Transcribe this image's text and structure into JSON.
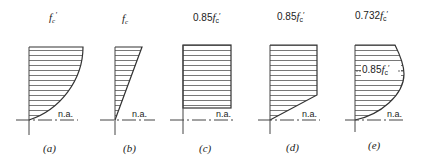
{
  "figure": {
    "panels": [
      {
        "id": "a",
        "top_label": "f′c",
        "top_label_prefix": "",
        "caption": "(a)",
        "na_label": "n.a.",
        "shape": "parabolic"
      },
      {
        "id": "b",
        "top_label": "fc",
        "top_label_prefix": "",
        "caption": "(b)",
        "na_label": "n.a.",
        "shape": "triangular"
      },
      {
        "id": "c",
        "top_label": "fc′",
        "top_label_prefix": "0.85",
        "caption": "(c)",
        "na_label": "n.a.",
        "shape": "rectangular"
      },
      {
        "id": "d",
        "top_label": "fc′",
        "top_label_prefix": "0.85",
        "caption": "(d)",
        "na_label": "n.a.",
        "shape": "trapezoidal"
      },
      {
        "id": "e",
        "top_label": "fc′",
        "top_label_prefix": "0.732",
        "caption": "(e)",
        "na_label": "n.a.",
        "shape": "curved",
        "inner_label_prefix": "0.85",
        "inner_label": "fc′"
      }
    ],
    "labels": {
      "a_top": "f",
      "a_sub": "c",
      "a_prime": "′",
      "b_top": "f",
      "b_sub": "c",
      "c_num": "0.85",
      "c_f": "f",
      "c_sub": "c",
      "c_prime": "′",
      "d_num": "0.85",
      "d_f": "f",
      "d_sub": "c",
      "d_prime": "′",
      "e_num": "0.732",
      "e_f": "f",
      "e_sub": "c",
      "e_prime": "′",
      "e_inner_num": "0.85",
      "e_inner_f": "f",
      "e_inner_sub": "c",
      "e_inner_prime": "′",
      "na": "n.a.",
      "cap_a": "(a)",
      "cap_b": "(b)",
      "cap_c": "(c)",
      "cap_d": "(d)",
      "cap_e": "(e)"
    }
  }
}
